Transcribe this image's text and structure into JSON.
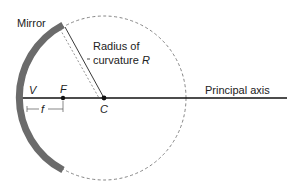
{
  "diagram": {
    "type": "concave mirror geometry",
    "labels": {
      "mirror": "Mirror",
      "radius_line1": "Radius of",
      "radius_line2": "curvature",
      "radius_symbol": "R",
      "principal_axis": "Principal axis",
      "vertex": "V",
      "focal_point": "F",
      "center": "C",
      "focal_length": "f"
    },
    "colors": {
      "mirror": "#6b6b6b",
      "lines": "#111111",
      "dashed_circle": "#777777"
    }
  }
}
